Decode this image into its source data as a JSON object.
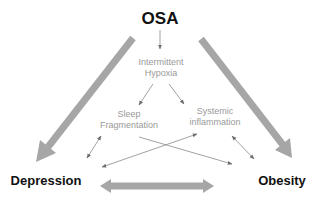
{
  "diagram": {
    "title": "OSA",
    "nodes": {
      "osa": {
        "label": "OSA"
      },
      "hypoxia": {
        "line1": "Intermittent",
        "line2": "Hypoxia"
      },
      "sleep": {
        "line1": "Sleep",
        "line2": "Fragmentation"
      },
      "inflammation": {
        "line1": "Systemic",
        "line2": "inflammation"
      },
      "depression": {
        "label": "Depression"
      },
      "obesity": {
        "label": "Obesity"
      }
    },
    "edges": [
      {
        "from": "OSA",
        "to": "Depression",
        "style": "thick",
        "direction": "forward"
      },
      {
        "from": "OSA",
        "to": "Obesity",
        "style": "thick",
        "direction": "forward"
      },
      {
        "from": "Depression",
        "to": "Obesity",
        "style": "thick",
        "direction": "both"
      },
      {
        "from": "OSA",
        "to": "Intermittent Hypoxia",
        "style": "thin",
        "direction": "forward"
      },
      {
        "from": "Intermittent Hypoxia",
        "to": "Sleep Fragmentation",
        "style": "thin",
        "direction": "forward"
      },
      {
        "from": "Intermittent Hypoxia",
        "to": "Systemic inflammation",
        "style": "thin",
        "direction": "forward"
      },
      {
        "from": "Sleep Fragmentation",
        "to": "Depression",
        "style": "thin",
        "direction": "both"
      },
      {
        "from": "Systemic inflammation",
        "to": "Obesity",
        "style": "thin",
        "direction": "both"
      },
      {
        "from": "Systemic inflammation",
        "to": "Depression",
        "style": "thin",
        "direction": "both"
      },
      {
        "from": "Sleep Fragmentation",
        "to": "Obesity",
        "style": "thin",
        "direction": "forward"
      }
    ],
    "colors": {
      "thick_arrow": "#a6a6a6",
      "thin_arrow": "#7a7a7a",
      "main_text": "#111111",
      "mechanism_text": "#9a9a9a"
    }
  }
}
